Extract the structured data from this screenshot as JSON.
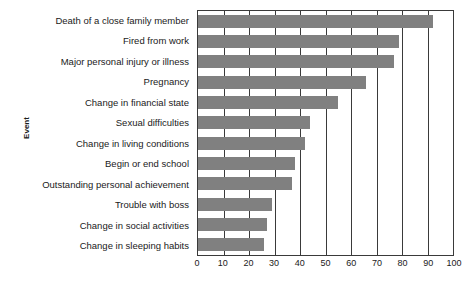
{
  "chart_data": {
    "type": "bar",
    "orientation": "horizontal",
    "title": "",
    "xlabel": "",
    "ylabel": "Event",
    "xlim": [
      0,
      100
    ],
    "xticks": [
      0,
      10,
      20,
      30,
      40,
      50,
      60,
      70,
      80,
      90,
      100
    ],
    "grid": true,
    "legend": false,
    "bar_color": "#808080",
    "axis_color": "#3a3a3a",
    "categories": [
      "Death of a close family member",
      "Fired from work",
      "Major personal injury or illness",
      "Pregnancy",
      "Change in financial state",
      "Sexual difficulties",
      "Change in living conditions",
      "Begin or end school",
      "Outstanding personal achievement",
      "Trouble with boss",
      "Change in social activities",
      "Change in sleeping habits"
    ],
    "values": [
      92,
      79,
      77,
      66,
      55,
      44,
      42,
      38,
      37,
      29,
      27,
      26
    ]
  }
}
